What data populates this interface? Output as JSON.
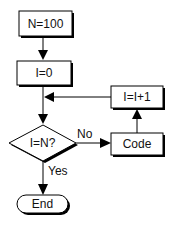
{
  "diagram": {
    "type": "flowchart",
    "nodes": [
      {
        "id": "init_n",
        "shape": "process",
        "label": "N=100"
      },
      {
        "id": "init_i",
        "shape": "process",
        "label": "I=0"
      },
      {
        "id": "decision",
        "shape": "decision",
        "label": "I=N?"
      },
      {
        "id": "code",
        "shape": "process",
        "label": "Code"
      },
      {
        "id": "increment",
        "shape": "process",
        "label": "I=I+1"
      },
      {
        "id": "end",
        "shape": "terminator",
        "label": "End"
      }
    ],
    "edges": [
      {
        "from": "init_n",
        "to": "init_i",
        "label": ""
      },
      {
        "from": "init_i",
        "to": "decision",
        "label": ""
      },
      {
        "from": "decision",
        "to": "code",
        "label": "No"
      },
      {
        "from": "code",
        "to": "increment",
        "label": ""
      },
      {
        "from": "increment",
        "to": "decision",
        "label": ""
      },
      {
        "from": "decision",
        "to": "end",
        "label": "Yes"
      }
    ]
  },
  "labels": {
    "n100": "N=100",
    "i0": "I=0",
    "inc": "I=I+1",
    "cond": "I=N?",
    "code": "Code",
    "end": "End",
    "no": "No",
    "yes": "Yes"
  },
  "colors": {
    "stroke": "#000000",
    "fill": "#ffffff",
    "shadow": "#000000"
  }
}
